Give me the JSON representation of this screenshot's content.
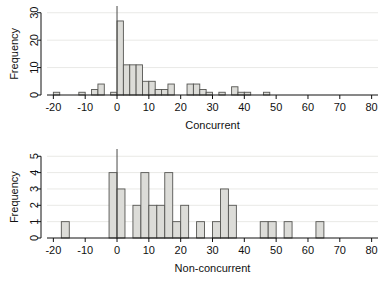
{
  "figure": {
    "kind": "two-panel-histogram",
    "bar_fill": "#dcdcd8",
    "bar_stroke": "#555552",
    "axis_color": "#111111",
    "grid_color": "#e9e9e6",
    "background": "#ffffff"
  },
  "chart_data": [
    {
      "type": "bar",
      "id": "concurrent-histogram",
      "title": "",
      "xlabel": "Concurrent",
      "ylabel": "Frequency",
      "xlim": [
        -22,
        82
      ],
      "ylim": [
        0,
        31
      ],
      "xticks": [
        -20,
        -10,
        0,
        10,
        20,
        30,
        40,
        50,
        60,
        70,
        80
      ],
      "xtick_labels": [
        "-20",
        "-10",
        "0",
        "10",
        "20",
        "30",
        "40",
        "50",
        "60",
        "70",
        "80"
      ],
      "yticks": [
        0,
        10,
        20,
        30
      ],
      "ytick_labels": [
        "0",
        "10",
        "20",
        "30"
      ],
      "grid": true,
      "bin_width": 2,
      "reference_line_x": 0,
      "bins": [
        {
          "x0": -20,
          "x1": -18,
          "count": 1
        },
        {
          "x0": -18,
          "x1": -16,
          "count": 0
        },
        {
          "x0": -16,
          "x1": -14,
          "count": 0
        },
        {
          "x0": -14,
          "x1": -12,
          "count": 0
        },
        {
          "x0": -12,
          "x1": -10,
          "count": 1
        },
        {
          "x0": -10,
          "x1": -8,
          "count": 0
        },
        {
          "x0": -8,
          "x1": -6,
          "count": 2
        },
        {
          "x0": -6,
          "x1": -4,
          "count": 4
        },
        {
          "x0": -4,
          "x1": -2,
          "count": 0
        },
        {
          "x0": -2,
          "x1": 0,
          "count": 1
        },
        {
          "x0": 0,
          "x1": 2,
          "count": 27
        },
        {
          "x0": 2,
          "x1": 4,
          "count": 11
        },
        {
          "x0": 4,
          "x1": 6,
          "count": 11
        },
        {
          "x0": 6,
          "x1": 8,
          "count": 11
        },
        {
          "x0": 8,
          "x1": 10,
          "count": 5
        },
        {
          "x0": 10,
          "x1": 12,
          "count": 5
        },
        {
          "x0": 12,
          "x1": 14,
          "count": 2
        },
        {
          "x0": 14,
          "x1": 16,
          "count": 2
        },
        {
          "x0": 16,
          "x1": 18,
          "count": 4
        },
        {
          "x0": 18,
          "x1": 20,
          "count": 0
        },
        {
          "x0": 20,
          "x1": 22,
          "count": 0
        },
        {
          "x0": 22,
          "x1": 24,
          "count": 4
        },
        {
          "x0": 24,
          "x1": 26,
          "count": 4
        },
        {
          "x0": 26,
          "x1": 28,
          "count": 2
        },
        {
          "x0": 28,
          "x1": 30,
          "count": 1
        },
        {
          "x0": 30,
          "x1": 32,
          "count": 0
        },
        {
          "x0": 32,
          "x1": 34,
          "count": 1
        },
        {
          "x0": 34,
          "x1": 36,
          "count": 0
        },
        {
          "x0": 36,
          "x1": 38,
          "count": 3
        },
        {
          "x0": 38,
          "x1": 40,
          "count": 1
        },
        {
          "x0": 40,
          "x1": 42,
          "count": 1
        },
        {
          "x0": 42,
          "x1": 44,
          "count": 0
        },
        {
          "x0": 44,
          "x1": 46,
          "count": 0
        },
        {
          "x0": 46,
          "x1": 48,
          "count": 1
        }
      ]
    },
    {
      "type": "bar",
      "id": "non-concurrent-histogram",
      "title": "",
      "xlabel": "Non-concurrent",
      "ylabel": "Frequency",
      "xlim": [
        -22,
        82
      ],
      "ylim": [
        0,
        5.2
      ],
      "xticks": [
        -20,
        -10,
        0,
        10,
        20,
        30,
        40,
        50,
        60,
        70,
        80
      ],
      "xtick_labels": [
        "-20",
        "-10",
        "0",
        "10",
        "20",
        "30",
        "40",
        "50",
        "60",
        "70",
        "80"
      ],
      "yticks": [
        0,
        1,
        2,
        3,
        4,
        5
      ],
      "ytick_labels": [
        "0",
        "1",
        "2",
        "3",
        "4",
        "5"
      ],
      "grid": true,
      "bin_width": 2.5,
      "reference_line_x": 0,
      "bins": [
        {
          "x0": -17.5,
          "x1": -15.0,
          "count": 1
        },
        {
          "x0": -15.0,
          "x1": -12.5,
          "count": 0
        },
        {
          "x0": -12.5,
          "x1": -10.0,
          "count": 0
        },
        {
          "x0": -10.0,
          "x1": -7.5,
          "count": 0
        },
        {
          "x0": -7.5,
          "x1": -5.0,
          "count": 0
        },
        {
          "x0": -5.0,
          "x1": -2.5,
          "count": 0
        },
        {
          "x0": -2.5,
          "x1": 0.0,
          "count": 4
        },
        {
          "x0": 0.0,
          "x1": 2.5,
          "count": 3
        },
        {
          "x0": 2.5,
          "x1": 5.0,
          "count": 0
        },
        {
          "x0": 5.0,
          "x1": 7.5,
          "count": 2
        },
        {
          "x0": 7.5,
          "x1": 10.0,
          "count": 4
        },
        {
          "x0": 10.0,
          "x1": 12.5,
          "count": 2
        },
        {
          "x0": 12.5,
          "x1": 15.0,
          "count": 2
        },
        {
          "x0": 15.0,
          "x1": 17.5,
          "count": 4
        },
        {
          "x0": 17.5,
          "x1": 20.0,
          "count": 1
        },
        {
          "x0": 20.0,
          "x1": 22.5,
          "count": 2
        },
        {
          "x0": 22.5,
          "x1": 25.0,
          "count": 0
        },
        {
          "x0": 25.0,
          "x1": 27.5,
          "count": 1
        },
        {
          "x0": 27.5,
          "x1": 30.0,
          "count": 0
        },
        {
          "x0": 30.0,
          "x1": 32.5,
          "count": 1
        },
        {
          "x0": 32.5,
          "x1": 35.0,
          "count": 3
        },
        {
          "x0": 35.0,
          "x1": 37.5,
          "count": 2
        },
        {
          "x0": 37.5,
          "x1": 40.0,
          "count": 0
        },
        {
          "x0": 40.0,
          "x1": 42.5,
          "count": 0
        },
        {
          "x0": 42.5,
          "x1": 45.0,
          "count": 0
        },
        {
          "x0": 45.0,
          "x1": 47.5,
          "count": 1
        },
        {
          "x0": 47.5,
          "x1": 50.0,
          "count": 1
        },
        {
          "x0": 50.0,
          "x1": 52.5,
          "count": 0
        },
        {
          "x0": 52.5,
          "x1": 55.0,
          "count": 1
        },
        {
          "x0": 55.0,
          "x1": 57.5,
          "count": 0
        },
        {
          "x0": 57.5,
          "x1": 60.0,
          "count": 0
        },
        {
          "x0": 60.0,
          "x1": 62.5,
          "count": 0
        },
        {
          "x0": 62.5,
          "x1": 65.0,
          "count": 1
        }
      ]
    }
  ]
}
